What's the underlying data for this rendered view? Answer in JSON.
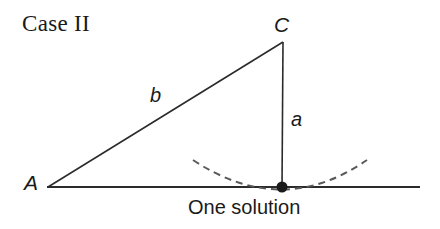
{
  "figure": {
    "title": "Case II",
    "caption": "One solution",
    "background_color": "#ffffff",
    "stroke_color": "#2b2b2b",
    "arc_color": "#5a5a5a",
    "point_color": "#1a1a1a",
    "text_color": "#1a1a1a"
  },
  "vertices": {
    "a": {
      "label": "A",
      "x": 48,
      "y": 187,
      "label_x": 24,
      "label_y": 190
    },
    "c": {
      "label": "C",
      "x": 283,
      "y": 42,
      "label_x": 274,
      "label_y": 32
    },
    "b": {
      "label": "",
      "x": 282,
      "y": 187
    }
  },
  "sides": {
    "a": {
      "label": "a",
      "label_x": 291,
      "label_y": 126
    },
    "b": {
      "label": "b",
      "label_x": 150,
      "label_y": 102
    }
  },
  "baseline": {
    "x1": 47,
    "y1": 187,
    "x2": 420,
    "y2": 187
  },
  "arc": {
    "start_x": 193,
    "start_y": 160,
    "end_x": 367,
    "end_y": 160,
    "tangent_x": 282,
    "tangent_y": 187,
    "dash": "7 5",
    "stroke_width": 2
  },
  "solution_point": {
    "cx": 282,
    "cy": 187,
    "r": 5.5
  },
  "caption_position": {
    "x": 188,
    "y": 214
  },
  "title_position": {
    "x": 22,
    "y": 31
  }
}
